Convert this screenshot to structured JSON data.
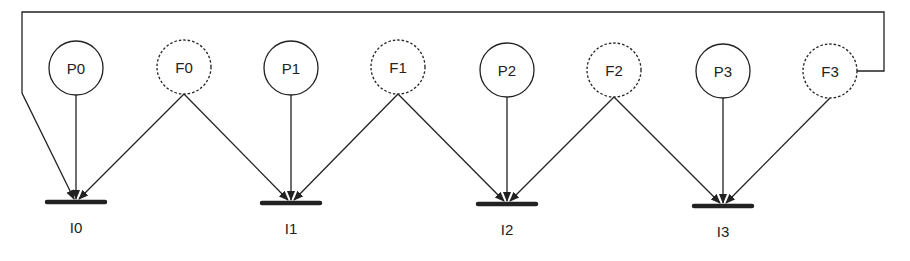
{
  "diagram": {
    "nodes": [
      {
        "id": "P0",
        "label": "P0",
        "style": "solid",
        "cx": 76,
        "cy": 68
      },
      {
        "id": "F0",
        "label": "F0",
        "style": "dashed",
        "cx": 184,
        "cy": 67
      },
      {
        "id": "P1",
        "label": "P1",
        "style": "solid",
        "cx": 291,
        "cy": 68
      },
      {
        "id": "F1",
        "label": "F1",
        "style": "dashed",
        "cx": 398,
        "cy": 67
      },
      {
        "id": "P2",
        "label": "P2",
        "style": "solid",
        "cx": 507,
        "cy": 70
      },
      {
        "id": "F2",
        "label": "F2",
        "style": "dashed",
        "cx": 614,
        "cy": 70
      },
      {
        "id": "P3",
        "label": "P3",
        "style": "solid",
        "cx": 723,
        "cy": 71
      },
      {
        "id": "F3",
        "label": "F3",
        "style": "dashed",
        "cx": 830,
        "cy": 71
      }
    ],
    "sinks": [
      {
        "id": "I0",
        "label": "I0",
        "x": 76,
        "y": 202
      },
      {
        "id": "I1",
        "label": "I1",
        "x": 291,
        "y": 203
      },
      {
        "id": "I2",
        "label": "I2",
        "x": 507,
        "y": 204
      },
      {
        "id": "I3",
        "label": "I3",
        "x": 723,
        "y": 206
      }
    ],
    "edges": [
      {
        "from": "P0",
        "to": "I0"
      },
      {
        "from": "F0",
        "to": "I0"
      },
      {
        "from": "F0",
        "to": "I1"
      },
      {
        "from": "P1",
        "to": "I1"
      },
      {
        "from": "F1",
        "to": "I1"
      },
      {
        "from": "F1",
        "to": "I2"
      },
      {
        "from": "P2",
        "to": "I2"
      },
      {
        "from": "F2",
        "to": "I2"
      },
      {
        "from": "F2",
        "to": "I3"
      },
      {
        "from": "P3",
        "to": "I3"
      },
      {
        "from": "F3",
        "to": "I3"
      },
      {
        "from": "F3",
        "to": "I0",
        "routing": "wrap-around-top"
      }
    ],
    "colors": {
      "stroke": "#222222",
      "background": "#ffffff"
    }
  }
}
